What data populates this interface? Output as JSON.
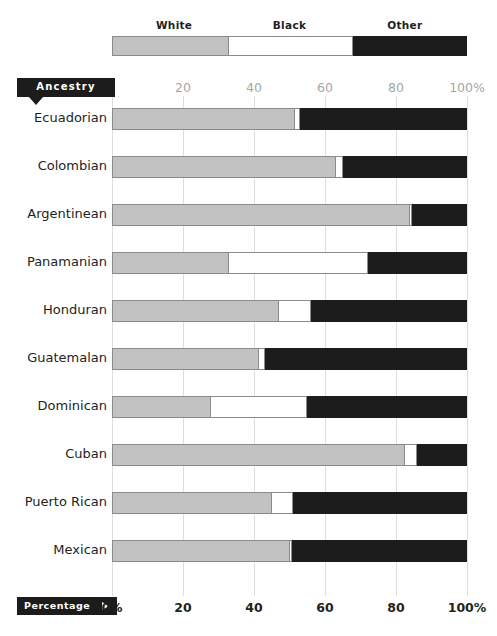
{
  "tags": {
    "ancestry_label": "Ancestry",
    "percentage_label": "Percentage",
    "percentage_arrow": "right-triangle",
    "ancestry_arrow": "down-triangle"
  },
  "legend": {
    "items": [
      {
        "label": "White",
        "color": "#c2c2c2",
        "center_pct": 17.5
      },
      {
        "label": "Black",
        "color": "#ffffff",
        "center_pct": 50.0
      },
      {
        "label": "Other",
        "color": "#1c1c1c",
        "center_pct": 82.5
      }
    ],
    "swatch_widths_pct": [
      33,
      35,
      32
    ]
  },
  "axis": {
    "top_ticks": [
      "20",
      "40",
      "60",
      "80",
      "100%"
    ],
    "top_tick_values": [
      20,
      40,
      60,
      80,
      100
    ],
    "bottom_ticks": [
      "0%",
      "20",
      "40",
      "60",
      "80",
      "100%"
    ],
    "bottom_tick_values": [
      0,
      20,
      40,
      60,
      80,
      100
    ],
    "gridline_values": [
      0,
      20,
      40,
      60,
      80,
      100
    ]
  },
  "chart_data": {
    "type": "bar",
    "orientation": "horizontal",
    "stacked": true,
    "normalized_percent": true,
    "title": "",
    "xlabel": "Percentage",
    "ylabel": "Ancestry",
    "xlim": [
      0,
      100
    ],
    "grid": true,
    "legend_position": "top",
    "categories": [
      "Ecuadorian",
      "Colombian",
      "Argentinean",
      "Panamanian",
      "Honduran",
      "Guatemalan",
      "Dominican",
      "Cuban",
      "Puerto Rican",
      "Mexican"
    ],
    "series": [
      {
        "name": "White",
        "color": "#c2c2c2",
        "values": [
          51.5,
          63,
          84,
          33,
          47,
          41.5,
          28,
          82.5,
          45,
          50
        ]
      },
      {
        "name": "Black",
        "color": "#ffffff",
        "values": [
          1.5,
          2,
          0.5,
          39,
          9,
          1.5,
          27,
          3.5,
          6,
          0.8
        ]
      },
      {
        "name": "Other",
        "color": "#1c1c1c",
        "values": [
          47,
          35,
          15.5,
          28,
          44,
          57,
          45,
          14,
          49,
          49.2
        ]
      }
    ]
  }
}
